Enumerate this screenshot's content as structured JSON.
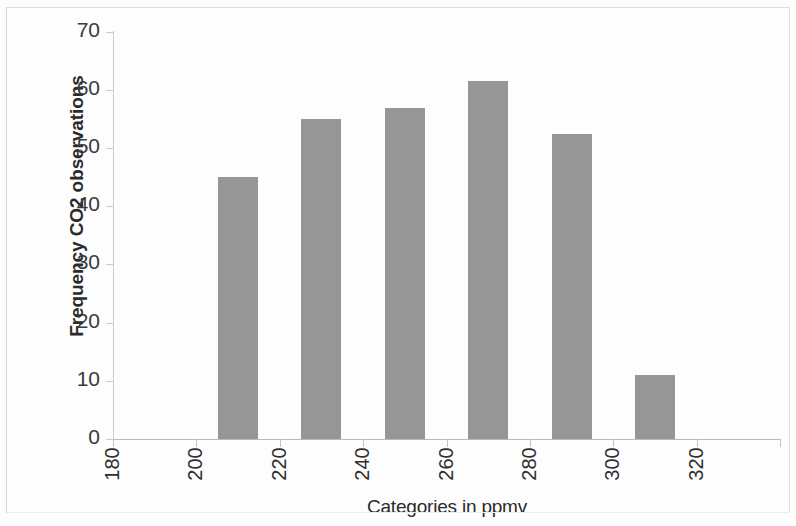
{
  "chart_data": {
    "type": "bar",
    "title": "",
    "subtitle": "",
    "xlabel": "Categories in ppmv",
    "ylabel": "Frequency CO2 observations",
    "categories": [
      "180",
      "200",
      "220",
      "240",
      "260",
      "280",
      "300",
      "320"
    ],
    "values": [
      0,
      45,
      55,
      57,
      61.5,
      52.5,
      11,
      0
    ],
    "ylim": [
      0,
      70
    ],
    "yticks": [
      0,
      10,
      20,
      30,
      40,
      50,
      60,
      70
    ],
    "ytick_labels": [
      "0",
      "10",
      "20",
      "30",
      "40",
      "50",
      "60",
      "70"
    ],
    "xtick_labels": [
      "180",
      "200",
      "220",
      "240",
      "260",
      "280",
      "300",
      "320"
    ],
    "grid": false,
    "legend": null,
    "legend_position": "none",
    "bar_color": "#969696",
    "axis_color": "#c2c2c2",
    "text_color": "#2f2f2f",
    "xtick_label_rotation": -90,
    "series": [
      {
        "name": "Frequency CO2 observations",
        "values": [
          0,
          45,
          55,
          57,
          61.5,
          52.5,
          11,
          0
        ]
      }
    ],
    "annotations": []
  }
}
